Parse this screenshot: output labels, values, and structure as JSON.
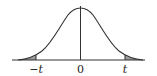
{
  "diagram": {
    "type": "normal-distribution-two-tailed",
    "labels": {
      "neg_t": "−t",
      "zero": "0",
      "pos_t": "t"
    },
    "colors": {
      "curve": "#333333",
      "axis": "#333333",
      "tail_fill": "#9a9a9a",
      "label": "#222222"
    }
  }
}
